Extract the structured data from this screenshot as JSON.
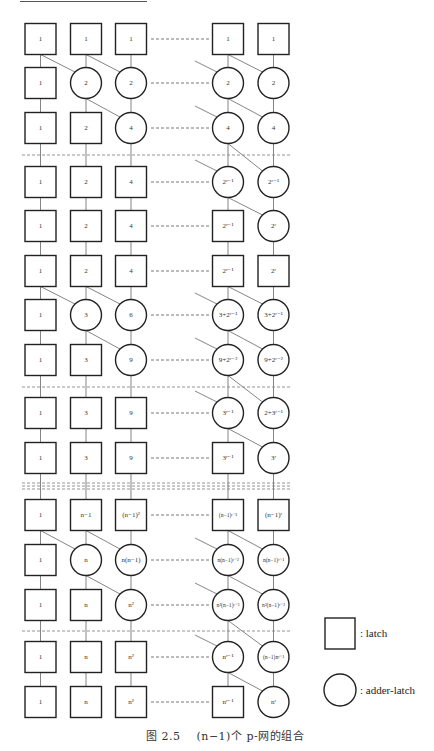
{
  "figure": {
    "caption_prefix": "图 2.5",
    "caption_text": "(n−1)个 p-网的组合",
    "columns": 5,
    "column_ellipsis": "between column 3 and column 4"
  },
  "legend": {
    "latch_label": ": latch",
    "adder_latch_label": ": adder-latch"
  },
  "separators": [
    {
      "after_row": 3,
      "style": "dashed"
    },
    {
      "after_row": 8,
      "style": "dashed"
    },
    {
      "after_row": 10,
      "style": "triple-dashed"
    },
    {
      "after_row": 13,
      "style": "dashed"
    }
  ],
  "rows": [
    {
      "row": 1,
      "cells": [
        {
          "t": "box",
          "v": "1"
        },
        {
          "t": "box",
          "v": "1"
        },
        {
          "t": "box",
          "v": "1"
        },
        {
          "t": "box",
          "v": "1"
        },
        {
          "t": "box",
          "v": "1"
        }
      ]
    },
    {
      "row": 2,
      "cells": [
        {
          "t": "box",
          "v": "1"
        },
        {
          "t": "circle",
          "v": "2"
        },
        {
          "t": "circle",
          "v": "2"
        },
        {
          "t": "circle",
          "v": "2"
        },
        {
          "t": "circle",
          "v": "2"
        }
      ]
    },
    {
      "row": 3,
      "cells": [
        {
          "t": "box",
          "v": "1"
        },
        {
          "t": "box",
          "v": "2"
        },
        {
          "t": "circle",
          "v": "4"
        },
        {
          "t": "circle",
          "v": "4"
        },
        {
          "t": "circle",
          "v": "4"
        }
      ]
    },
    {
      "row": 4,
      "cells": [
        {
          "t": "box",
          "v": "1"
        },
        {
          "t": "box",
          "v": "2"
        },
        {
          "t": "box",
          "v": "4"
        },
        {
          "t": "circle",
          "v": "2^(r−1)"
        },
        {
          "t": "circle",
          "v": "2^(r−1)"
        }
      ]
    },
    {
      "row": 5,
      "cells": [
        {
          "t": "box",
          "v": "1"
        },
        {
          "t": "box",
          "v": "2"
        },
        {
          "t": "box",
          "v": "4"
        },
        {
          "t": "box",
          "v": "2^(r−1)"
        },
        {
          "t": "circle",
          "v": "2^r"
        }
      ]
    },
    {
      "row": 6,
      "cells": [
        {
          "t": "box",
          "v": "1"
        },
        {
          "t": "box",
          "v": "2"
        },
        {
          "t": "box",
          "v": "4"
        },
        {
          "t": "box",
          "v": "2^(r−1)"
        },
        {
          "t": "box",
          "v": "2^r"
        }
      ]
    },
    {
      "row": 7,
      "cells": [
        {
          "t": "box",
          "v": "1"
        },
        {
          "t": "circle",
          "v": "3"
        },
        {
          "t": "circle",
          "v": "6"
        },
        {
          "t": "circle",
          "v": "3+2^(r−1)"
        },
        {
          "t": "circle",
          "v": "3+2^(r−1)"
        }
      ]
    },
    {
      "row": 8,
      "cells": [
        {
          "t": "box",
          "v": "1"
        },
        {
          "t": "box",
          "v": "3"
        },
        {
          "t": "circle",
          "v": "9"
        },
        {
          "t": "circle",
          "v": "9+2^(r−2)"
        },
        {
          "t": "circle",
          "v": "9+2^(r−2)"
        }
      ]
    },
    {
      "row": 9,
      "cells": [
        {
          "t": "box",
          "v": "1"
        },
        {
          "t": "box",
          "v": "3"
        },
        {
          "t": "box",
          "v": "9"
        },
        {
          "t": "circle",
          "v": "3^(r−1)"
        },
        {
          "t": "circle",
          "v": "2+3^(r−1)"
        }
      ]
    },
    {
      "row": 10,
      "cells": [
        {
          "t": "box",
          "v": "1"
        },
        {
          "t": "box",
          "v": "3"
        },
        {
          "t": "box",
          "v": "9"
        },
        {
          "t": "box",
          "v": "3^(r−1)"
        },
        {
          "t": "circle",
          "v": "3^r"
        }
      ]
    },
    {
      "row": 11,
      "cells": [
        {
          "t": "box",
          "v": "1"
        },
        {
          "t": "box",
          "v": "n−1"
        },
        {
          "t": "box",
          "v": "(n−1)^2"
        },
        {
          "t": "box",
          "v": "(n−1)^(r−1)"
        },
        {
          "t": "box",
          "v": "(n−1)^r"
        }
      ]
    },
    {
      "row": 12,
      "cells": [
        {
          "t": "box",
          "v": "1"
        },
        {
          "t": "circle",
          "v": "n"
        },
        {
          "t": "circle",
          "v": "n(n−1)"
        },
        {
          "t": "circle",
          "v": "n(n−1)^(r−2)"
        },
        {
          "t": "circle",
          "v": "n(n−1)^(r−1)"
        }
      ]
    },
    {
      "row": 13,
      "cells": [
        {
          "t": "box",
          "v": "1"
        },
        {
          "t": "box",
          "v": "n"
        },
        {
          "t": "circle",
          "v": "n^2"
        },
        {
          "t": "circle",
          "v": "n^2(n−1)^(r−3)"
        },
        {
          "t": "circle",
          "v": "n^2(n−1)^(r−2)"
        }
      ]
    },
    {
      "row": 14,
      "cells": [
        {
          "t": "box",
          "v": "1"
        },
        {
          "t": "box",
          "v": "n"
        },
        {
          "t": "box",
          "v": "n^2"
        },
        {
          "t": "circle",
          "v": "n^(r−1)"
        },
        {
          "t": "circle",
          "v": "(n−1)n^(r−1)"
        }
      ]
    },
    {
      "row": 15,
      "cells": [
        {
          "t": "box",
          "v": "1"
        },
        {
          "t": "box",
          "v": "n"
        },
        {
          "t": "box",
          "v": "n^2"
        },
        {
          "t": "box",
          "v": "n^(r−1)"
        },
        {
          "t": "circle",
          "v": "n^r"
        }
      ]
    }
  ],
  "labels": {
    "r1": [
      "1",
      "1",
      "1",
      "1",
      "1"
    ],
    "r2": [
      "1",
      "2",
      "2",
      "2",
      "2"
    ],
    "r3": [
      "1",
      "2",
      "4",
      "4",
      "4"
    ],
    "r4": [
      "1",
      "2",
      "4",
      "2ʳ⁻¹",
      "2ʳ⁻¹"
    ],
    "r5": [
      "1",
      "2",
      "4",
      "2ʳ⁻¹",
      "2ʳ"
    ],
    "r6": [
      "1",
      "2",
      "4",
      "2ʳ⁻¹",
      "2ʳ"
    ],
    "r7": [
      "1",
      "3",
      "6",
      "3+2ʳ⁻¹",
      "3+2ʳ⁻¹"
    ],
    "r8": [
      "1",
      "3",
      "9",
      "9+2ʳ⁻²",
      "9+2ʳ⁻²"
    ],
    "r9": [
      "1",
      "3",
      "9",
      "3ʳ⁻¹",
      "2+3ʳ⁻¹"
    ],
    "r10": [
      "1",
      "3",
      "9",
      "3ʳ⁻¹",
      "3ʳ"
    ],
    "r11": [
      "1",
      "n−1",
      "(n−1)²",
      "(n−1)ʳ⁻¹",
      "(n−1)ʳ"
    ],
    "r12": [
      "1",
      "n",
      "n(n−1)",
      "n(n−1)ʳ⁻²",
      "n(n−1)ʳ⁻¹"
    ],
    "r13": [
      "1",
      "n",
      "n²",
      "n²(n−1)ʳ⁻³",
      "n²(n−1)ʳ⁻²"
    ],
    "r14": [
      "1",
      "n",
      "n²",
      "nʳ⁻¹",
      "(n−1)nʳ⁻¹"
    ],
    "r15": [
      "1",
      "n",
      "n²",
      "nʳ⁻¹",
      "nʳ"
    ]
  }
}
